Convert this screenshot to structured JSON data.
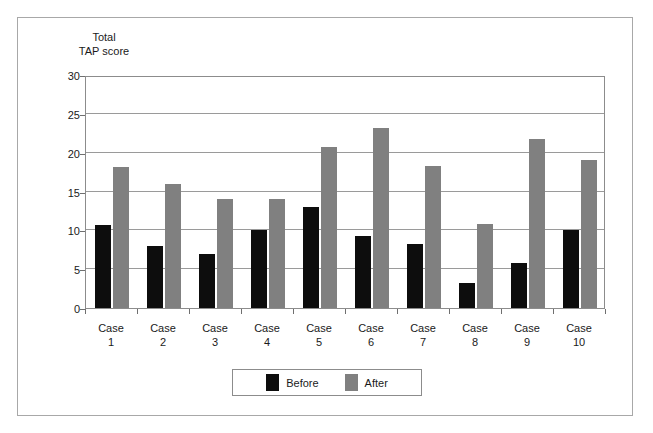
{
  "chart_data": {
    "type": "bar",
    "title": "",
    "subtitle": "",
    "xlabel": "",
    "ylabel": "Total\nTAP score",
    "ylim": [
      0,
      30
    ],
    "yticks": [
      0,
      5,
      10,
      15,
      20,
      25,
      30
    ],
    "ytick_labels": [
      "0",
      "5",
      "10",
      "15",
      "20",
      "25",
      "30"
    ],
    "grid": true,
    "legend_position": "bottom-center",
    "categories": [
      "Case\n1",
      "Case\n2",
      "Case\n3",
      "Case\n4",
      "Case\n5",
      "Case\n6",
      "Case\n7",
      "Case\n8",
      "Case\n9",
      "Case\n10"
    ],
    "series": [
      {
        "name": "Before",
        "color": "#0d0d0d",
        "values": [
          10.7,
          8.0,
          6.9,
          10.0,
          13.0,
          9.3,
          8.3,
          3.2,
          5.8,
          10.0
        ]
      },
      {
        "name": "After",
        "color": "#808080",
        "values": [
          18.2,
          16.0,
          14.0,
          14.0,
          20.7,
          23.2,
          18.3,
          10.8,
          21.8,
          19.0
        ]
      }
    ],
    "legend": [
      {
        "label": "Before",
        "color": "#0d0d0d",
        "swatch": "black-swatch"
      },
      {
        "label": "After",
        "color": "#808080",
        "swatch": "gray-swatch"
      }
    ]
  },
  "figure": {
    "frame_color": "#a8a8a8",
    "axis_color": "#8c8c8c",
    "gridline_color": "#9a9a9a",
    "background": "#ffffff"
  }
}
